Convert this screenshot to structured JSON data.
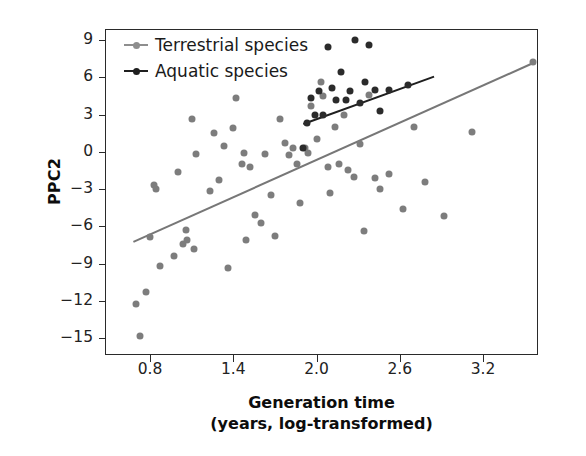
{
  "chart_data": {
    "type": "scatter",
    "title": "",
    "xlabel": "Generation time\n(years, log-transformed)",
    "xlabel_line1": "Generation time",
    "xlabel_line2": "(years, log-transformed)",
    "ylabel": "PPC2",
    "xlim": [
      0.62,
      3.74
    ],
    "ylim": [
      -16.3,
      10.5
    ],
    "xticks": [
      "0.8",
      "1.4",
      "2.0",
      "2.6",
      "3.2"
    ],
    "xtick_values": [
      0.8,
      1.4,
      2.0,
      2.6,
      3.2
    ],
    "yticks": [
      "9",
      "6",
      "3",
      "0",
      "-3",
      "-6",
      "-9",
      "-12",
      "-15"
    ],
    "ytick_values": [
      9,
      6,
      3,
      0,
      -3,
      -6,
      -9,
      -12,
      -15
    ],
    "grid": false,
    "legend_position": "top-left",
    "colors": {
      "terrestrial": "#7d7d7d",
      "aquatic": "#2b2b2b",
      "axis": "#2a2a2a",
      "background": "#ffffff"
    },
    "series": [
      {
        "name": "Terrestrial species",
        "marker": "circle",
        "color": "#7d7d7d",
        "points": [
          [
            0.7,
            -12.3
          ],
          [
            0.73,
            -14.8
          ],
          [
            0.77,
            -11.3
          ],
          [
            0.8,
            -6.9
          ],
          [
            0.83,
            -2.7
          ],
          [
            0.84,
            -3.0
          ],
          [
            0.87,
            -9.2
          ],
          [
            0.97,
            -8.4
          ],
          [
            1.0,
            -1.6
          ],
          [
            1.04,
            -7.4
          ],
          [
            1.06,
            -6.3
          ],
          [
            1.07,
            -7.1
          ],
          [
            1.1,
            2.6
          ],
          [
            1.12,
            -7.8
          ],
          [
            1.13,
            -0.2
          ],
          [
            1.23,
            -3.2
          ],
          [
            1.26,
            1.5
          ],
          [
            1.3,
            -2.3
          ],
          [
            1.33,
            0.5
          ],
          [
            1.36,
            -9.4
          ],
          [
            1.4,
            1.9
          ],
          [
            1.42,
            4.3
          ],
          [
            1.46,
            -1.0
          ],
          [
            1.48,
            -0.1
          ],
          [
            1.49,
            -7.1
          ],
          [
            1.52,
            -1.2
          ],
          [
            1.56,
            -5.1
          ],
          [
            1.6,
            -5.7
          ],
          [
            1.63,
            -0.2
          ],
          [
            1.67,
            -3.5
          ],
          [
            1.7,
            -6.8
          ],
          [
            1.74,
            2.6
          ],
          [
            1.77,
            0.7
          ],
          [
            1.8,
            -0.3
          ],
          [
            1.83,
            0.3
          ],
          [
            1.86,
            -1.0
          ],
          [
            1.88,
            -4.1
          ],
          [
            1.92,
            0.3
          ],
          [
            1.94,
            -0.1
          ],
          [
            1.96,
            3.7
          ],
          [
            2.0,
            1.0
          ],
          [
            2.03,
            5.6
          ],
          [
            2.05,
            4.5
          ],
          [
            2.08,
            -1.2
          ],
          [
            2.1,
            -3.3
          ],
          [
            2.13,
            2.0
          ],
          [
            2.16,
            -1.0
          ],
          [
            2.2,
            3.0
          ],
          [
            2.23,
            -1.5
          ],
          [
            2.27,
            -2.0
          ],
          [
            2.31,
            0.6
          ],
          [
            2.34,
            -6.4
          ],
          [
            2.38,
            4.6
          ],
          [
            2.42,
            -2.1
          ],
          [
            2.46,
            -3.0
          ],
          [
            2.52,
            -1.8
          ],
          [
            2.62,
            -4.6
          ],
          [
            2.7,
            2.0
          ],
          [
            2.78,
            -2.4
          ],
          [
            2.92,
            -5.2
          ],
          [
            3.12,
            1.6
          ],
          [
            3.56,
            7.2
          ]
        ]
      },
      {
        "name": "Aquatic species",
        "marker": "circle",
        "color": "#2b2b2b",
        "points": [
          [
            1.9,
            0.3
          ],
          [
            1.93,
            2.3
          ],
          [
            1.96,
            4.3
          ],
          [
            1.99,
            3.0
          ],
          [
            2.02,
            4.9
          ],
          [
            2.05,
            3.0
          ],
          [
            2.08,
            8.4
          ],
          [
            2.11,
            5.1
          ],
          [
            2.14,
            4.2
          ],
          [
            2.18,
            6.4
          ],
          [
            2.21,
            4.2
          ],
          [
            2.24,
            4.9
          ],
          [
            2.28,
            9.0
          ],
          [
            2.31,
            3.9
          ],
          [
            2.35,
            5.6
          ],
          [
            2.38,
            8.6
          ],
          [
            2.42,
            5.0
          ],
          [
            2.46,
            3.3
          ],
          [
            2.52,
            5.0
          ],
          [
            2.66,
            5.4
          ]
        ]
      }
    ],
    "trendlines": [
      {
        "name": "Terrestrial species trend",
        "color": "#777777",
        "x_start": 0.68,
        "y_start": -7.2,
        "x_end": 3.56,
        "y_end": 7.2
      },
      {
        "name": "Aquatic species trend",
        "color": "#1f1f1f",
        "x_start": 1.9,
        "y_start": 2.3,
        "x_end": 2.84,
        "y_end": 6.1
      }
    ],
    "legend": [
      {
        "label": "Terrestrial species",
        "color": "#7d7d7d",
        "key": "terrestrial"
      },
      {
        "label": "Aquatic species",
        "color": "#2b2b2b",
        "key": "aquatic"
      }
    ]
  }
}
